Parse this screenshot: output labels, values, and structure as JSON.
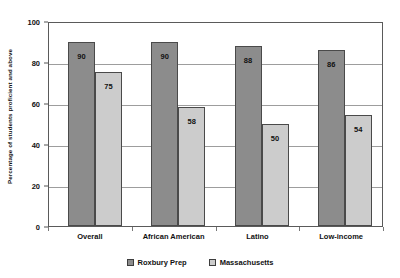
{
  "chart_data": {
    "type": "bar",
    "title": "",
    "xlabel": "",
    "ylabel": "Percentage of students proficient and above",
    "ylim": [
      0,
      100
    ],
    "yticks": [
      0,
      20,
      40,
      60,
      80,
      100
    ],
    "ytick_labels": [
      "0",
      "20",
      "40",
      "60",
      "80",
      "100"
    ],
    "grid": true,
    "legend_position": "bottom",
    "categories": [
      "Overall",
      "African American",
      "Latino",
      "Low-income"
    ],
    "series": [
      {
        "name": "Roxbury Prep",
        "color": "#8c8c8c",
        "values": [
          90,
          90,
          88,
          86
        ],
        "value_labels": [
          "90",
          "90",
          "88",
          "86"
        ]
      },
      {
        "name": "Massachusetts",
        "color": "#cccccc",
        "values": [
          75,
          58,
          50,
          54
        ],
        "value_labels": [
          "75",
          "58",
          "50",
          "54"
        ]
      }
    ]
  }
}
